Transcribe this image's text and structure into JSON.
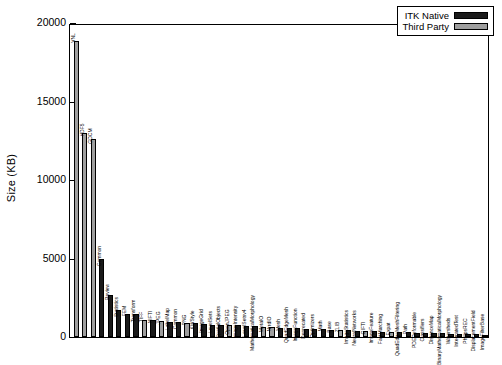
{
  "axis": {
    "ylabel": "Size (KB)",
    "ticks": [
      "0",
      "5000",
      "10000",
      "15000",
      "20000"
    ]
  },
  "legend": {
    "items": [
      {
        "label": "ITK Native",
        "color": "#1a1a1a",
        "type": "native"
      },
      {
        "label": "Third Party",
        "color": "#9e9e9e",
        "type": "third"
      }
    ]
  },
  "chart_data": {
    "type": "bar",
    "title": "",
    "xlabel": "",
    "ylabel": "Size (KB)",
    "ylim": [
      0,
      20000
    ],
    "yticks": [
      0,
      5000,
      10000,
      15000,
      20000
    ],
    "grid": false,
    "legend_position": "top-right",
    "series": [
      {
        "name": "ITK Native",
        "color": "#1a1a1a"
      },
      {
        "name": "Third Party",
        "color": "#9e9e9e"
      }
    ],
    "categories": [
      "VNL",
      "HDF5",
      "GDCM",
      "Common",
      "Review",
      "Statistics",
      "FEM",
      "Transform",
      "TIFF",
      "NIFTI",
      "JPEG",
      "LabelMap",
      "Common",
      "PNG",
      "KWStyle",
      "ImageGrid",
      "LevelSets",
      "SpatialObjects",
      "OpenJPEG",
      "ImageIntensity",
      "LevelSetsv4",
      "MathematicalMorphology",
      "MetaIO",
      "NrrdIO",
      "Mesh",
      "QuadEdgeMesh",
      "ImageFunction",
      "Deprecated",
      "Optimizers",
      "Math",
      "Base",
      "ZLIB",
      "ImageStatistics",
      "NeuralNetworks",
      "GIFTI",
      "ImageFeature",
      "FastMarching",
      "Expat",
      "QuadEdgeMeshFiltering",
      "Path",
      "PDEDeformable",
      "Classifiers",
      "DistanceMap",
      "BinaryMathematicalMorphology",
      "Watersheds",
      "IntegratedTest",
      "PhilipsREC",
      "DisplacementField",
      "ImageFilterBase"
    ],
    "values": [
      19000,
      13100,
      12700,
      5000,
      2700,
      1700,
      1500,
      1480,
      1120,
      1060,
      1000,
      980,
      960,
      900,
      880,
      830,
      800,
      780,
      760,
      740,
      700,
      680,
      640,
      620,
      600,
      580,
      560,
      540,
      520,
      500,
      470,
      440,
      420,
      400,
      380,
      360,
      340,
      320,
      300,
      290,
      275,
      260,
      245,
      230,
      215,
      200,
      185,
      165,
      140
    ],
    "bar_types": [
      "third",
      "third",
      "third",
      "native",
      "native",
      "native",
      "native",
      "native",
      "third",
      "native",
      "third",
      "native",
      "native",
      "third",
      "native",
      "native",
      "native",
      "native",
      "third",
      "native",
      "native",
      "native",
      "third",
      "third",
      "native",
      "native",
      "native",
      "native",
      "native",
      "native",
      "native",
      "third",
      "native",
      "native",
      "third",
      "native",
      "native",
      "third",
      "native",
      "native",
      "native",
      "native",
      "native",
      "native",
      "native",
      "native",
      "native",
      "native",
      "native"
    ]
  }
}
